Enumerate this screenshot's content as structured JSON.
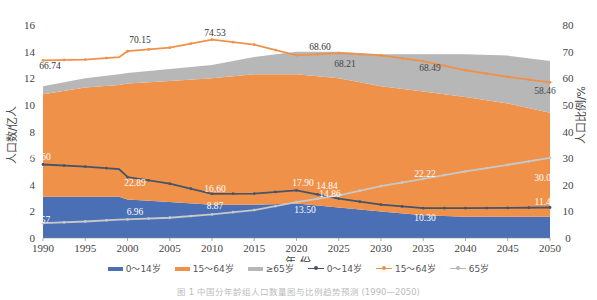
{
  "chart_data": {
    "type": "area",
    "title": "",
    "xlabel": "年 份",
    "ylabel": "人口数/亿人",
    "y2label": "人口比例/%",
    "ylim": [
      0,
      16
    ],
    "y2lim": [
      0,
      80
    ],
    "xlim": [
      1990,
      2050
    ],
    "x_ticks": [
      "1990",
      "1995",
      "2000",
      "2005",
      "2010",
      "2015",
      "2020",
      "2025",
      "2030",
      "2035",
      "2040",
      "2045",
      "2050"
    ],
    "y_ticks": [
      "0",
      "2",
      "4",
      "6",
      "8",
      "10",
      "12",
      "14",
      "16"
    ],
    "y2_ticks": [
      "0",
      "10",
      "20",
      "30",
      "40",
      "50",
      "60",
      "70",
      "80"
    ],
    "grid": false,
    "legend_position": "bottom",
    "x": [
      1990,
      1995,
      1999,
      2000,
      2005,
      2010,
      2015,
      2020,
      2025,
      2030,
      2035,
      2040,
      2045,
      2050
    ],
    "stacked_area_series": [
      {
        "name": "0～14岁",
        "axis": "left",
        "color": "#4472c4",
        "values": [
          3.1,
          3.1,
          3.1,
          2.9,
          2.7,
          2.5,
          2.5,
          2.6,
          2.3,
          2.0,
          1.7,
          1.6,
          1.6,
          1.6
        ]
      },
      {
        "name": "15～64岁",
        "axis": "left",
        "color": "#ed7d31",
        "values": [
          7.7,
          8.2,
          8.4,
          8.7,
          9.1,
          9.5,
          9.8,
          9.7,
          9.7,
          9.4,
          9.3,
          9.0,
          8.5,
          7.8
        ]
      },
      {
        "name": "≥65岁",
        "axis": "left",
        "color": "#a5a5a5",
        "values": [
          0.6,
          0.7,
          0.8,
          0.8,
          0.9,
          1.0,
          1.3,
          1.7,
          2.0,
          2.4,
          2.8,
          3.2,
          3.6,
          3.9
        ]
      }
    ],
    "line_series": [
      {
        "name": "0～14岁",
        "axis": "right",
        "color": "#44546a",
        "values": [
          27.6,
          26.8,
          25.9,
          22.9,
          20.4,
          16.6,
          16.7,
          17.9,
          14.8,
          12.5,
          11.2,
          11.2,
          11.3,
          11.45
        ]
      },
      {
        "name": "15～64岁",
        "axis": "right",
        "color": "#ed7d31",
        "values": [
          66.74,
          67.0,
          67.9,
          70.15,
          71.5,
          74.53,
          72.6,
          68.6,
          69.4,
          68.6,
          66.4,
          63.0,
          60.5,
          58.46
        ]
      },
      {
        "name": "65岁",
        "axis": "right",
        "color": "#b0b0b0",
        "values": [
          5.57,
          6.2,
          6.9,
          6.96,
          7.6,
          8.87,
          10.5,
          13.5,
          16.0,
          19.5,
          22.2,
          25.0,
          27.5,
          30.09
        ]
      }
    ],
    "annotations": [
      {
        "text": "66.74",
        "x": 1990,
        "series": "15～64岁"
      },
      {
        "text": "70.15",
        "x": 2000,
        "series": "15～64岁"
      },
      {
        "text": "74.53",
        "x": 2010,
        "series": "15～64岁"
      },
      {
        "text": "68.60",
        "x": 2020,
        "series": "15～64岁"
      },
      {
        "text": "68.21",
        "x": 2022,
        "series": "15～64岁"
      },
      {
        "text": "68.49",
        "x": 2034,
        "series": "15～64岁"
      },
      {
        "text": "58.46",
        "x": 2050,
        "series": "15～64岁"
      },
      {
        "text": "27.60",
        "x": 1990,
        "series": "0～14岁"
      },
      {
        "text": "22.89",
        "x": 2000,
        "series": "0～14岁"
      },
      {
        "text": "16.60",
        "x": 2010,
        "series": "0～14岁"
      },
      {
        "text": "17.90",
        "x": 2020,
        "series": "0～14岁"
      },
      {
        "text": "14.84",
        "x": 2022,
        "series": "0～14岁"
      },
      {
        "text": "11.45",
        "x": 2050,
        "series": "0～14岁"
      },
      {
        "text": "5.57",
        "x": 1990,
        "series": "65岁"
      },
      {
        "text": "6.96",
        "x": 2000,
        "series": "65岁"
      },
      {
        "text": "8.87",
        "x": 2010,
        "series": "65岁"
      },
      {
        "text": "13.50",
        "x": 2020,
        "series": "65岁"
      },
      {
        "text": "14.86",
        "x": 2022,
        "series": "65岁"
      },
      {
        "text": "22.22",
        "x": 2035,
        "series": "65岁"
      },
      {
        "text": "30.09",
        "x": 2050,
        "series": "65岁"
      },
      {
        "text": "10.30",
        "x": 2035,
        "series": "0～14岁 area"
      }
    ]
  },
  "legend": {
    "items": [
      {
        "label": "0～14岁",
        "kind": "area",
        "color": "#4a6fb5"
      },
      {
        "label": "15～64岁",
        "kind": "area",
        "color": "#f0914a"
      },
      {
        "label": "≥65岁",
        "kind": "area",
        "color": "#b7b7b7"
      },
      {
        "label": "0～14岁",
        "kind": "line",
        "color": "#44546a"
      },
      {
        "label": "15～64岁",
        "kind": "line",
        "color": "#f0914a"
      },
      {
        "label": "65岁",
        "kind": "line",
        "color": "#b7b7b7"
      }
    ]
  },
  "caption": "图 1 中国分年龄组人口数量图与比例趋势预测 (1990—2050)"
}
